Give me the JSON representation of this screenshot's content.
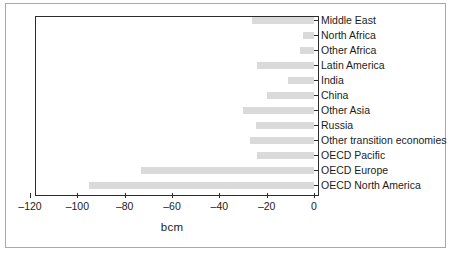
{
  "chart_data": {
    "type": "bar",
    "orientation": "horizontal",
    "title": "",
    "subtitle": "",
    "xlabel": "bcm",
    "ylabel": "",
    "xlim": [
      -120,
      0
    ],
    "xticks": [
      -120,
      -100,
      -80,
      -60,
      -40,
      -20,
      0
    ],
    "xtick_labels": [
      "–120",
      "–100",
      "–80",
      "–60",
      "–40",
      "–20",
      "0"
    ],
    "grid": false,
    "legend": null,
    "bar_color": "#dadada",
    "axis_color": "#2b2b2b",
    "frame_color": "#a9a9a9",
    "categories": [
      "Middle East",
      "North Africa",
      "Other Africa",
      "Latin America",
      "India",
      "China",
      "Other Asia",
      "Russia",
      "Other transition economies",
      "OECD Pacific",
      "OECD Europe",
      "OECD North America"
    ],
    "values": [
      -26,
      -4.5,
      -6,
      -24,
      -11,
      -20,
      -30,
      -24.5,
      -27,
      -24,
      -73,
      -95
    ],
    "series": [
      {
        "name": "bcm",
        "values": [
          -26,
          -4.5,
          -6,
          -24,
          -11,
          -20,
          -30,
          -24.5,
          -27,
          -24,
          -73,
          -95
        ]
      }
    ]
  }
}
